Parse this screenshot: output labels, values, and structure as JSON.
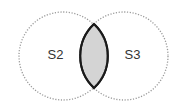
{
  "diagram": {
    "type": "venn",
    "sets": [
      {
        "id": "S2",
        "label": "S2",
        "cx": 63,
        "cy": 56,
        "r": 44,
        "label_x": 55.5,
        "label_y": 59
      },
      {
        "id": "S3",
        "label": "S3",
        "cx": 124,
        "cy": 56,
        "r": 44,
        "label_x": 132.5,
        "label_y": 59
      }
    ],
    "highlighted_region": "S2 ∩ S3",
    "colors": {
      "circle_stroke": "#9a9a9a",
      "intersection_fill": "#d4d4d4",
      "intersection_stroke": "#1a1a1a",
      "label": "#333333",
      "background": "#ffffff"
    }
  }
}
